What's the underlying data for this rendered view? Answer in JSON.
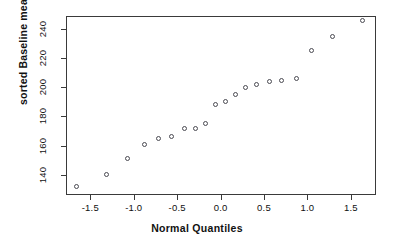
{
  "chart_data": {
    "type": "scatter",
    "title": "",
    "xlabel": "Normal Quantiles",
    "ylabel": "sorted Baseline measurements",
    "xlim": [
      -1.78,
      1.79
    ],
    "ylim": [
      126,
      249
    ],
    "grid": false,
    "legend": null,
    "xticks": [
      -1.5,
      -1.0,
      -0.5,
      0.0,
      0.5,
      1.0,
      1.5
    ],
    "xtick_labels": [
      "-1.5",
      "-1.0",
      "-0.5",
      "0.0",
      "0.5",
      "1.0",
      "1.5"
    ],
    "yticks": [
      140,
      160,
      180,
      200,
      220,
      240
    ],
    "ytick_labels": [
      "140",
      "160",
      "180",
      "200",
      "220",
      "240"
    ],
    "marker": "open-circle",
    "marker_color": "#4a4a52",
    "points": [
      {
        "x": -1.66,
        "y": 132
      },
      {
        "x": -1.31,
        "y": 140
      },
      {
        "x": -1.07,
        "y": 151
      },
      {
        "x": -0.88,
        "y": 161
      },
      {
        "x": -0.72,
        "y": 165
      },
      {
        "x": -0.57,
        "y": 166
      },
      {
        "x": -0.41,
        "y": 172
      },
      {
        "x": -0.29,
        "y": 172
      },
      {
        "x": -0.17,
        "y": 175
      },
      {
        "x": -0.06,
        "y": 188
      },
      {
        "x": 0.06,
        "y": 190
      },
      {
        "x": 0.17,
        "y": 195
      },
      {
        "x": 0.29,
        "y": 200
      },
      {
        "x": 0.41,
        "y": 202
      },
      {
        "x": 0.56,
        "y": 204
      },
      {
        "x": 0.7,
        "y": 205
      },
      {
        "x": 0.88,
        "y": 206
      },
      {
        "x": 1.05,
        "y": 225
      },
      {
        "x": 1.29,
        "y": 235
      },
      {
        "x": 1.63,
        "y": 246
      }
    ]
  },
  "axes": {
    "x_title": "Normal Quantiles",
    "y_title": "sorted Baseline measurements"
  }
}
